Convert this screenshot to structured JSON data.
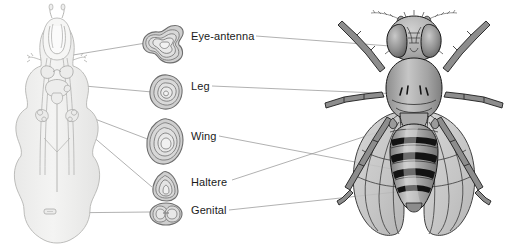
{
  "figure": {
    "width": 511,
    "height": 249,
    "background": "#ffffff"
  },
  "panels": {
    "larva": {
      "name": "Drosophila larva with imaginal discs",
      "body_fill": "#f0f0ef",
      "body_stroke": "#b8b8b6"
    },
    "discs_column": {
      "name": "Isolated imaginal discs"
    },
    "adult": {
      "name": "Adult Drosophila melanogaster, dorsal view",
      "body_fill": "#9a9a9a",
      "dark_band": "#1c1c1c"
    }
  },
  "labels": [
    {
      "id": "eye-antenna",
      "text": "Eye-antenna"
    },
    {
      "id": "leg",
      "text": "Leg"
    },
    {
      "id": "wing",
      "text": "Wing"
    },
    {
      "id": "haltere",
      "text": "Haltere"
    },
    {
      "id": "genital",
      "text": "Genital"
    }
  ],
  "colors": {
    "leader_line": "#8f8f8f",
    "larva_outline": "#b5b5b3",
    "larva_fill": "#f1f1f0",
    "disc_outline": "#6e6e6e",
    "disc_fill_outer": "#cfcfcf",
    "disc_fill_inner": "#e8e8e8",
    "fly_outline": "#111111",
    "fly_body": "#9c9c9c",
    "fly_highlight": "#d7d7d7",
    "wing_fill": "#c4c4c4",
    "text": "#1a1a1a"
  },
  "icons": {
    "eye_antenna_disc": "eye-antenna-disc-icon",
    "leg_disc": "leg-disc-icon",
    "wing_disc": "wing-disc-icon",
    "haltere_disc": "haltere-disc-icon",
    "genital_disc": "genital-disc-icon"
  }
}
